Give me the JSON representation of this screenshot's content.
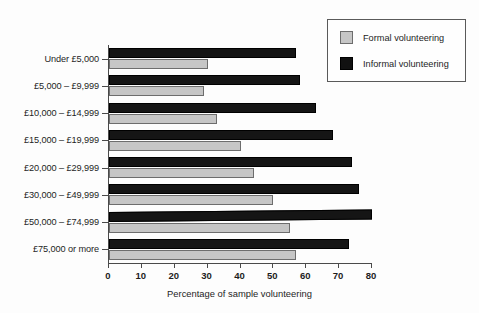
{
  "chart_data": {
    "type": "bar",
    "orientation": "horizontal",
    "title": "",
    "xlabel": "Percentage of sample volunteering",
    "ylabel": "",
    "xlim": [
      0,
      80
    ],
    "xticks": [
      0,
      10,
      20,
      30,
      40,
      50,
      60,
      70,
      80
    ],
    "grid": false,
    "legend_position": "top-right",
    "categories": [
      "Under £5,000",
      "£5,000 – £9,999",
      "£10,000 – £14,999",
      "£15,000 – £19,999",
      "£20,000 – £29,999",
      "£30,000 –  £49,999",
      "£50,000 – £74,999",
      "£75,000 or more"
    ],
    "series": [
      {
        "name": "Formal volunteering",
        "color": "#c6c6c6",
        "values": [
          30,
          29,
          33,
          40,
          44,
          50,
          55,
          57
        ]
      },
      {
        "name": "Informal volunteering",
        "color": "#111111",
        "values": [
          57,
          58,
          63,
          68,
          74,
          76,
          80,
          73
        ]
      }
    ]
  },
  "legend": {
    "items": [
      {
        "label": "Formal volunteering",
        "swatch": "formal-swatch"
      },
      {
        "label": "Informal volunteering",
        "swatch": "informal-swatch"
      }
    ]
  },
  "axis": {
    "x_title": "Percentage of sample volunteering",
    "tick_labels": [
      "0",
      "10",
      "20",
      "30",
      "40",
      "50",
      "60",
      "70",
      "80"
    ]
  }
}
